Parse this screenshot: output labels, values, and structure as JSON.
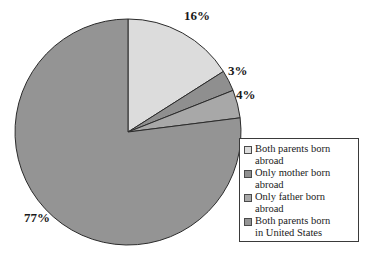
{
  "chart_data": {
    "type": "pie",
    "title": "",
    "categories": [
      "Both parents born abroad",
      "Only mother born abroad",
      "Only father born abroad",
      "Both parents born in United States"
    ],
    "values": [
      16,
      3,
      4,
      77
    ],
    "value_labels": [
      "16%",
      "3%",
      "4%",
      "77%"
    ],
    "unit": "percent",
    "start_angle_deg": 0,
    "direction": "clockwise",
    "legend_position": "right",
    "grid": false,
    "colors": [
      "#dcdcdc",
      "#8f8f8f",
      "#a8a8a8",
      "#949494"
    ],
    "slice_outline_color": "#2b2b2b"
  },
  "labels": {
    "slice_0": "16%",
    "slice_1": "3%",
    "slice_2": "4%",
    "slice_3": "77%"
  },
  "legend": {
    "items": [
      {
        "label": "Both parents born\nabroad",
        "color": "#dcdcdc"
      },
      {
        "label": "Only mother born\nabroad",
        "color": "#8f8f8f"
      },
      {
        "label": "Only father born\nabroad",
        "color": "#a8a8a8"
      },
      {
        "label": "Both parents born\nin United States",
        "color": "#949494"
      }
    ]
  }
}
